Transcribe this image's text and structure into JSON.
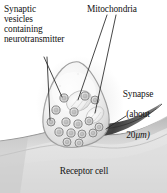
{
  "figure": {
    "kind": "biology-illustration",
    "background_color": "#ffffff",
    "text_color": "#141414"
  },
  "labels": {
    "vesicles": "Synaptic\nvesicles\ncontaining\nneurotransmitter",
    "mitochondria": "Mitochondria",
    "synapse_line1": "Synapse",
    "synapse_line2": "(about",
    "synapse_value": "20",
    "synapse_unit": "μm)",
    "receptor": "Receptor cell"
  },
  "structures": {
    "terminal_name": "synaptic-terminal",
    "receptor_name": "receptor-cell",
    "cleft_name": "synaptic-cleft",
    "vesicle_count": 16,
    "mitochondria_count": 2,
    "leader_line_count": 5
  },
  "colors": {
    "membrane_outline": "#8e8e8e",
    "terminal_fill": "#efefef",
    "terminal_shade": "#cfcfcf",
    "cytosol": "#f6f6f6",
    "vesicle_ring": "#8a8a8a",
    "vesicle_fill": "#dcdcdc",
    "mitochondria_fill": "#f3f3f3",
    "mitochondria_edge": "#bdbdbd",
    "receptor_fill": "#e3e3e3",
    "receptor_shade": "#b9b9b9",
    "cleft_dark": "#4a4a4a",
    "leader_line": "#2b2b2b"
  }
}
